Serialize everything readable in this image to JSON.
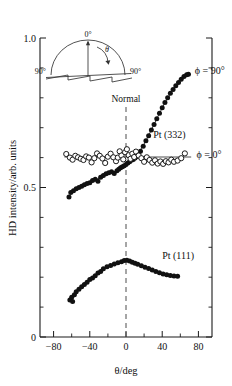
{
  "chart_data": {
    "type": "scatter",
    "title": "",
    "xlabel": "θ/deg",
    "ylabel": "HD intensity/arb. units",
    "xlim": [
      -95,
      95
    ],
    "ylim": [
      0,
      1.0
    ],
    "xticks": [
      -80,
      -40,
      0,
      40,
      80
    ],
    "xticklabels": [
      "−80",
      "−40",
      "0",
      "40",
      "80"
    ],
    "yticks": [
      0,
      0.5,
      1.0
    ],
    "yticklabels": [
      "0",
      "0.5",
      "1.0"
    ],
    "xminorticks": [
      -60,
      -20,
      20,
      60
    ],
    "yminorticks": [
      0.1,
      0.2,
      0.3,
      0.4,
      0.6,
      0.7,
      0.8,
      0.9
    ],
    "grid": false,
    "legend_position": "inline-right",
    "marker_colors": {
      "filled": "#111111",
      "open_fill": "#ffffff",
      "open_stroke": "#111111",
      "line": "#2a2a2a",
      "dashed": "#4d4d4d"
    },
    "annotations": [
      {
        "text": "Normal",
        "x": 0,
        "y": 0.785,
        "name": "normal-label"
      },
      {
        "text": "Pt (332)",
        "x": 30,
        "y": 0.665,
        "name": "pt332-label"
      },
      {
        "text": "Pt (111)",
        "x": 40,
        "y": 0.262,
        "name": "pt111-label"
      },
      {
        "text": "ϕ = 90°",
        "x": 76,
        "y": 0.878,
        "name": "phi90-label"
      },
      {
        "text": "ϕ = 0°",
        "x": 78,
        "y": 0.598,
        "name": "phi0-label"
      }
    ],
    "series": [
      {
        "name": "Pt (332) ϕ = 90°",
        "marker": "filled-circle",
        "label": "ϕ = 90°",
        "x": [
          -63,
          -61,
          -58,
          -55,
          -52,
          -49,
          -46,
          -43,
          -40,
          -37,
          -34,
          -31,
          -28,
          -25,
          -22,
          -19,
          -16,
          -13,
          -10,
          -8,
          -6,
          -4,
          -2,
          0,
          2,
          4,
          6,
          8,
          10,
          12,
          14,
          16,
          19,
          22,
          25,
          28,
          31,
          34,
          37,
          40,
          43,
          46,
          49,
          52,
          55,
          58,
          61,
          64,
          67,
          69
        ],
        "y": [
          0.468,
          0.483,
          0.489,
          0.496,
          0.5,
          0.504,
          0.509,
          0.513,
          0.516,
          0.523,
          0.528,
          0.521,
          0.534,
          0.54,
          0.546,
          0.549,
          0.553,
          0.547,
          0.556,
          0.561,
          0.566,
          0.569,
          0.573,
          0.577,
          0.582,
          0.586,
          0.591,
          0.594,
          0.599,
          0.604,
          0.612,
          0.621,
          0.638,
          0.656,
          0.673,
          0.692,
          0.711,
          0.73,
          0.748,
          0.767,
          0.784,
          0.8,
          0.815,
          0.828,
          0.84,
          0.851,
          0.862,
          0.871,
          0.877,
          0.879
        ]
      },
      {
        "name": "Pt (332) ϕ = 0°",
        "marker": "open-circle",
        "label": "ϕ = 0°",
        "x": [
          -66,
          -62,
          -59,
          -56,
          -53,
          -50,
          -47,
          -44,
          -41,
          -38,
          -35,
          -32,
          -29,
          -26,
          -23,
          -20,
          -17,
          -14,
          -11,
          -9,
          -7,
          -5,
          -3,
          -1,
          1,
          3,
          5,
          7,
          9,
          11,
          14,
          17,
          20,
          23,
          26,
          29,
          32,
          35,
          38,
          41,
          44,
          47,
          50,
          53,
          57,
          61,
          65
        ],
        "y": [
          0.612,
          0.6,
          0.593,
          0.606,
          0.601,
          0.596,
          0.592,
          0.604,
          0.6,
          0.584,
          0.598,
          0.614,
          0.606,
          0.597,
          0.582,
          0.603,
          0.613,
          0.601,
          0.588,
          0.6,
          0.621,
          0.607,
          0.594,
          0.618,
          0.628,
          0.608,
          0.596,
          0.613,
          0.602,
          0.62,
          0.607,
          0.598,
          0.586,
          0.601,
          0.592,
          0.583,
          0.591,
          0.58,
          0.587,
          0.579,
          0.588,
          0.584,
          0.593,
          0.586,
          0.59,
          0.598,
          0.614
        ]
      },
      {
        "name": "Pt (111)",
        "marker": "filled-circle",
        "label": "Pt (111)",
        "x": [
          -62,
          -60,
          -59,
          -57,
          -55,
          -52,
          -49,
          -46,
          -43,
          -40,
          -37,
          -34,
          -31,
          -28,
          -25,
          -21,
          -17,
          -13,
          -9,
          -5,
          -2,
          1,
          4,
          7,
          10,
          13,
          17,
          21,
          25,
          29,
          33,
          37,
          41,
          45,
          49,
          53,
          57
        ],
        "y": [
          0.124,
          0.133,
          0.119,
          0.141,
          0.151,
          0.16,
          0.168,
          0.176,
          0.183,
          0.192,
          0.197,
          0.205,
          0.214,
          0.219,
          0.228,
          0.235,
          0.239,
          0.244,
          0.248,
          0.252,
          0.256,
          0.257,
          0.254,
          0.25,
          0.247,
          0.243,
          0.238,
          0.233,
          0.229,
          0.224,
          0.219,
          0.215,
          0.211,
          0.208,
          0.206,
          0.204,
          0.203
        ]
      }
    ],
    "reference_lines": [
      {
        "name": "normal-dashed-line",
        "orientation": "vertical",
        "x": 0,
        "y_from": 0.0,
        "y_to": 0.77,
        "style": "dashed"
      },
      {
        "name": "phi0-guide-line",
        "orientation": "horizontal",
        "y": 0.602,
        "x_from": -68,
        "x_to": 72,
        "style": "solid"
      }
    ],
    "inset": {
      "name": "angle-geometry-inset",
      "labels": [
        {
          "text": "0°",
          "name": "inset-zero-deg-label"
        },
        {
          "text": "θ",
          "name": "inset-theta-label"
        },
        {
          "text": "90°",
          "name": "inset-left-90-label"
        },
        {
          "text": "90°",
          "name": "inset-right-90-label"
        }
      ],
      "description": "semicircular arc over a stepped vicinal surface with normal axis"
    }
  }
}
